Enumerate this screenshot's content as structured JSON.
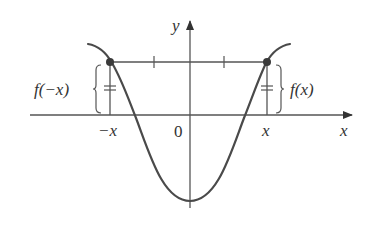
{
  "figure": {
    "colors": {
      "axis": "#555555",
      "curve": "#4a4a4a",
      "point": "#3a3a3a",
      "text": "#333333"
    },
    "axes": {
      "x_axis_label": "x",
      "y_axis_label": "y",
      "origin_label": "0"
    },
    "tick_labels": {
      "neg_x": "−x",
      "pos_x": "x"
    },
    "annotations": {
      "left_value": "f(−x)",
      "right_value": "f(x)"
    },
    "points": [
      {
        "name": "point-neg-x",
        "label": "(−x, f(−x))"
      },
      {
        "name": "point-pos-x",
        "label": "(x, f(x))"
      }
    ]
  }
}
